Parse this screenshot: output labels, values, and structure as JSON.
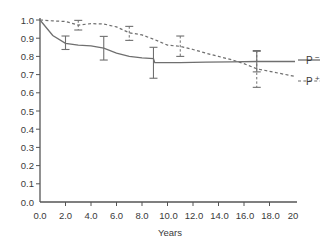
{
  "chart_data": {
    "type": "line",
    "title": "",
    "xlabel": "Years",
    "ylabel": "",
    "xlim": [
      0.0,
      20.0
    ],
    "ylim": [
      0.0,
      1.0
    ],
    "grid": false,
    "legend_position": "right",
    "x_ticks": [
      "0.0",
      "2.0",
      "4.0",
      "6.0",
      "8.0",
      "10.0",
      "12.0",
      "14.0",
      "16.0",
      "18.0",
      "20"
    ],
    "x_tick_values": [
      0,
      2,
      4,
      6,
      8,
      10,
      12,
      14,
      16,
      18,
      20
    ],
    "y_ticks": [
      "0.0",
      "0.1",
      "0.2",
      "0.3",
      "0.4",
      "0.5",
      "0.6",
      "0.7",
      "0.8",
      "0.9",
      "1.0"
    ],
    "y_tick_values": [
      0.0,
      0.1,
      0.2,
      0.3,
      0.4,
      0.5,
      0.6,
      0.7,
      0.8,
      0.9,
      1.0
    ],
    "series": [
      {
        "name": "P −",
        "label": "P",
        "sup": "−",
        "style": "solid",
        "color": "#6f6f6f",
        "x": [
          0.0,
          1.0,
          2.0,
          3.0,
          4.0,
          5.0,
          6.0,
          7.0,
          8.0,
          8.9,
          9.0,
          11.0,
          13.0,
          15.0,
          17.0,
          20.0
        ],
        "y": [
          1.0,
          0.915,
          0.872,
          0.862,
          0.858,
          0.845,
          0.818,
          0.8,
          0.792,
          0.788,
          0.766,
          0.766,
          0.768,
          0.77,
          0.772,
          0.772
        ],
        "error_bars": [
          {
            "x": 2.0,
            "y": 0.872,
            "low": 0.838,
            "high": 0.912
          },
          {
            "x": 5.0,
            "y": 0.845,
            "low": 0.78,
            "high": 0.91
          },
          {
            "x": 8.9,
            "y": 0.766,
            "low": 0.68,
            "high": 0.85
          },
          {
            "x": 17.0,
            "y": 0.772,
            "low": 0.715,
            "high": 0.828
          }
        ]
      },
      {
        "name": "P +",
        "label": "P",
        "sup": "+",
        "style": "dashed",
        "color": "#6f6f6f",
        "x": [
          0.0,
          1.0,
          2.0,
          3.0,
          4.0,
          5.0,
          6.0,
          7.0,
          8.0,
          9.0,
          10.0,
          11.0,
          12.0,
          13.0,
          14.0,
          15.0,
          16.0,
          17.0,
          18.0,
          20.0
        ],
        "y": [
          1.0,
          0.995,
          0.992,
          0.972,
          0.98,
          0.978,
          0.962,
          0.93,
          0.918,
          0.892,
          0.862,
          0.855,
          0.838,
          0.818,
          0.8,
          0.782,
          0.76,
          0.732,
          0.718,
          0.69
        ],
        "error_bars": [
          {
            "x": 3.0,
            "y": 0.972,
            "low": 0.945,
            "high": 0.998
          },
          {
            "x": 7.0,
            "y": 0.93,
            "low": 0.888,
            "high": 0.965
          },
          {
            "x": 11.0,
            "y": 0.855,
            "low": 0.8,
            "high": 0.912
          },
          {
            "x": 17.0,
            "y": 0.732,
            "low": 0.63,
            "high": 0.832
          }
        ]
      }
    ]
  }
}
